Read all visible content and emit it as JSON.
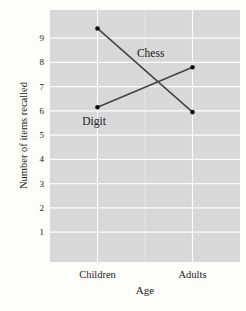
{
  "chart_data": {
    "type": "line",
    "categories": [
      "Children",
      "Adults"
    ],
    "series": [
      {
        "name": "Chess",
        "values": [
          9.4,
          5.95
        ]
      },
      {
        "name": "Digit",
        "values": [
          6.15,
          7.8
        ]
      }
    ],
    "annotations": [
      {
        "text": "Chess",
        "x_frac": 0.53,
        "y_value": 8.4
      },
      {
        "text": "Digit",
        "x_frac": 0.232,
        "y_value": 5.58
      }
    ],
    "title": "",
    "xlabel": "Age",
    "ylabel": "Number of items recalled",
    "yticks": [
      1,
      2,
      3,
      4,
      5,
      6,
      7,
      8,
      9
    ],
    "ylim": [
      -0.23,
      10.16
    ],
    "grid": "major-horizontal, major-vertical-at-categories, minor-vertical-midpoint",
    "legend": "none (direct line labels)",
    "colors": {
      "panel_background": "#d8d8d8",
      "gridline": "#ffffff",
      "line": "#454545",
      "point": "#111111",
      "text": "#1a1a1a",
      "page_background": "#fdfdfa"
    }
  }
}
